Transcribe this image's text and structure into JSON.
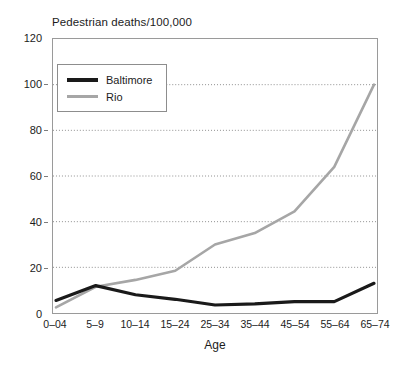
{
  "chart_data": {
    "type": "line",
    "title": "Pedestrian deaths/100,000",
    "xlabel": "Age",
    "ylabel": "",
    "categories": [
      "0–04",
      "5–9",
      "10–14",
      "15–24",
      "25–34",
      "35–44",
      "45–54",
      "55–64",
      "65–74"
    ],
    "ylim": [
      0,
      120
    ],
    "yticks": [
      0,
      20,
      40,
      60,
      80,
      100,
      120
    ],
    "grid": "horizontal-dotted",
    "legend_position": "upper-left-inside",
    "series": [
      {
        "name": "Baltimore",
        "color": "#1a1a1a",
        "values": [
          5.5,
          12,
          8,
          6,
          3.5,
          4,
          5,
          5,
          13
        ]
      },
      {
        "name": "Rio",
        "color": "#a6a6a6",
        "values": [
          2.5,
          11.5,
          14.5,
          18.5,
          30,
          35,
          44.5,
          64,
          100
        ]
      }
    ]
  },
  "axis": {
    "y_tick_labels": [
      "0",
      "20",
      "40",
      "60",
      "80",
      "100",
      "120"
    ],
    "x_tick_labels": [
      "0–04",
      "5–9",
      "10–14",
      "15–24",
      "25–34",
      "35–44",
      "45–54",
      "55–64",
      "65–74"
    ],
    "x_title": "Age"
  },
  "legend": {
    "entries": [
      {
        "label": "Baltimore",
        "color": "#1a1a1a"
      },
      {
        "label": "Rio",
        "color": "#a6a6a6"
      }
    ]
  }
}
